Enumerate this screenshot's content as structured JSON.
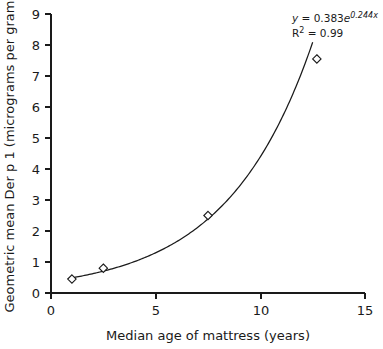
{
  "chart_data": {
    "type": "scatter",
    "title": "",
    "xlabel": "Median age of mattress (years)",
    "ylabel": "Geometric mean Der p 1 (micrograms per gram)",
    "xlim": [
      0,
      15
    ],
    "ylim": [
      0,
      9
    ],
    "xticks": [
      0,
      5,
      10,
      15
    ],
    "xtick_labels": [
      "0",
      "5",
      "10",
      "15"
    ],
    "yticks": [
      0,
      1,
      2,
      3,
      4,
      5,
      6,
      7,
      8,
      9
    ],
    "ytick_labels": [
      "0",
      "1",
      "2",
      "3",
      "4",
      "5",
      "6",
      "7",
      "8",
      "9"
    ],
    "grid": false,
    "legend": "none",
    "marker_style": "open-diamond",
    "x": [
      1.0,
      2.5,
      7.5,
      12.7
    ],
    "y": [
      0.45,
      0.8,
      2.5,
      7.55
    ],
    "points": [
      {
        "x": 1.0,
        "y": 0.45
      },
      {
        "x": 2.5,
        "y": 0.8
      },
      {
        "x": 7.5,
        "y": 2.5
      },
      {
        "x": 12.7,
        "y": 7.55
      }
    ],
    "fit": {
      "model": "exponential",
      "coefficient": 0.383,
      "rate": 0.244,
      "r_squared": 0.99,
      "x_start": 0.8,
      "x_end": 12.5
    },
    "annotations": {
      "equation_y": "y",
      "equation_eq": " = 0.383",
      "equation_e": "e",
      "equation_exp": "0.244x",
      "r_squared_label": "R",
      "r_squared_sup": "2",
      "r_squared_value": " = 0.99"
    }
  }
}
